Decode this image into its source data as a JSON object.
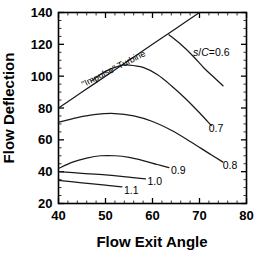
{
  "chart_data": {
    "type": "line",
    "title": "",
    "xlabel": "Flow Exit Angle",
    "ylabel": "Flow Deflection",
    "xlim": [
      40,
      80
    ],
    "ylim": [
      20,
      140
    ],
    "xticks": [
      40,
      50,
      60,
      70,
      80
    ],
    "yticks": [
      20,
      40,
      60,
      80,
      100,
      120,
      140
    ],
    "xtick_labels": [
      "40",
      "50",
      "60",
      "70",
      "80"
    ],
    "ytick_labels": [
      "20",
      "40",
      "60",
      "80",
      "100",
      "120",
      "140"
    ],
    "grid": false,
    "legend": "none",
    "minor_ticks": true,
    "series": [
      {
        "name": "\"Impulse\" Turbine",
        "label": "\"Impulse\" Turbine",
        "label_kind": "annotation",
        "x": [
          40,
          45,
          50,
          55,
          60,
          65,
          70
        ],
        "y": [
          80,
          90,
          100,
          110,
          120,
          130,
          140
        ]
      },
      {
        "name": "s/C=0.6",
        "label": "s/C=0.6",
        "label_kind": "curve-label",
        "x": [
          63.5,
          66,
          68.5,
          71,
          73,
          75
        ],
        "y": [
          126,
          120,
          113,
          105,
          99.5,
          94
        ]
      },
      {
        "name": "0.7",
        "label": "0.7",
        "label_kind": "curve-label",
        "x": [
          47,
          50,
          53,
          55,
          58,
          61,
          64,
          67,
          70,
          72.5
        ],
        "y": [
          97,
          103,
          106.5,
          107,
          105.5,
          101,
          94,
          86,
          77,
          69
        ]
      },
      {
        "name": "0.8",
        "label": "0.8",
        "label_kind": "curve-label",
        "x": [
          40,
          44,
          48,
          52,
          56,
          60,
          64,
          68,
          72,
          75
        ],
        "y": [
          71,
          74,
          76,
          76.5,
          75,
          71.5,
          66,
          59,
          51.5,
          46
        ]
      },
      {
        "name": "0.9",
        "label": "0.9",
        "label_kind": "curve-label",
        "x": [
          40,
          43,
          46,
          49,
          52,
          55,
          58,
          61,
          63.5
        ],
        "y": [
          42,
          46,
          48.5,
          50,
          50,
          49,
          47,
          44.5,
          42.5
        ]
      },
      {
        "name": "1.0",
        "label": "1.0",
        "label_kind": "curve-label",
        "x": [
          40,
          45,
          50,
          55,
          58.5
        ],
        "y": [
          40,
          39,
          38,
          36.5,
          35.5
        ]
      },
      {
        "name": "1.1",
        "label": "1.1",
        "label_kind": "curve-label",
        "x": [
          40,
          45,
          50,
          53.5
        ],
        "y": [
          34.5,
          33,
          31.5,
          30.5
        ]
      }
    ],
    "annotations": [
      {
        "text": "\"Impulse\" Turbine",
        "x": 52,
        "y": 103,
        "rotation": -27
      }
    ],
    "curve_labels": [
      {
        "text": "s/C=0.6",
        "x": 72.5,
        "y": 115,
        "italic_prefix": true
      },
      {
        "text": "0.7",
        "x": 73.5,
        "y": 67
      },
      {
        "text": "0.8",
        "x": 76.5,
        "y": 44
      },
      {
        "text": "0.9",
        "x": 65.5,
        "y": 41
      },
      {
        "text": "1.0",
        "x": 60.5,
        "y": 34
      },
      {
        "text": "1.1",
        "x": 55.5,
        "y": 28
      }
    ],
    "colors": {
      "curve": "#1a1a1a",
      "axis": "#000000",
      "background": "#ffffff"
    }
  }
}
